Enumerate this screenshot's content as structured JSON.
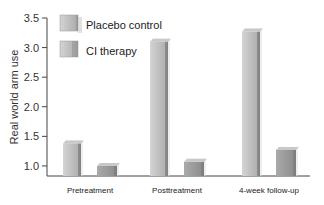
{
  "chart_data": {
    "type": "bar",
    "title": "",
    "xlabel": "",
    "ylabel": "Real world arm use",
    "ylim": [
      0.83,
      3.5
    ],
    "yticks": [
      1.0,
      1.5,
      2.0,
      2.5,
      3.0,
      3.5
    ],
    "ytick_labels": [
      "1.0",
      "1.5",
      "2.0",
      "2.5",
      "3.0",
      "3.5"
    ],
    "categories": [
      "Pretreatment",
      "Posttreatment",
      "4-week follow-up"
    ],
    "series": [
      {
        "name": "Placebo control",
        "values": [
          1.38,
          3.1,
          3.27
        ],
        "color": "#b8b8b8"
      },
      {
        "name": "CI therapy",
        "values": [
          1.0,
          1.07,
          1.27
        ],
        "color": "#9a9a9a"
      }
    ],
    "grid": false,
    "legend_position": "upper left",
    "style": "3d-shaded bars"
  }
}
